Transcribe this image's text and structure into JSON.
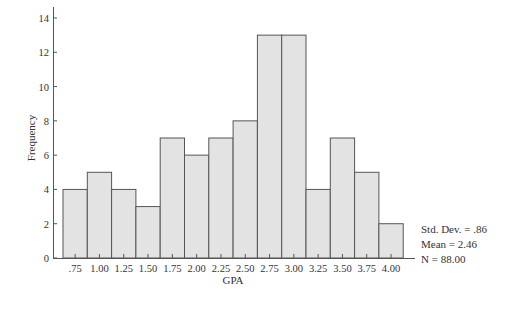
{
  "chart_data": {
    "type": "bar",
    "subtype": "histogram",
    "title": "",
    "xlabel": "GPA",
    "ylabel": "Frequency",
    "categories": [
      ".75",
      "1.00",
      "1.25",
      "1.50",
      "1.75",
      "2.00",
      "2.25",
      "2.50",
      "2.75",
      "3.00",
      "3.25",
      "3.50",
      "3.75",
      "4.00"
    ],
    "values": [
      4,
      5,
      4,
      3,
      7,
      6,
      7,
      8,
      13,
      13,
      4,
      7,
      5,
      2
    ],
    "ylim": [
      0,
      14
    ],
    "yticks": [
      0,
      2,
      4,
      6,
      8,
      10,
      12,
      14
    ],
    "grid": false,
    "legend": "none",
    "bar_fill": "#e3e3e3",
    "bar_stroke": "#555555",
    "stats": {
      "std_dev": "Std. Dev. = .86",
      "mean": "Mean = 2.46",
      "n": "N = 88.00"
    }
  }
}
